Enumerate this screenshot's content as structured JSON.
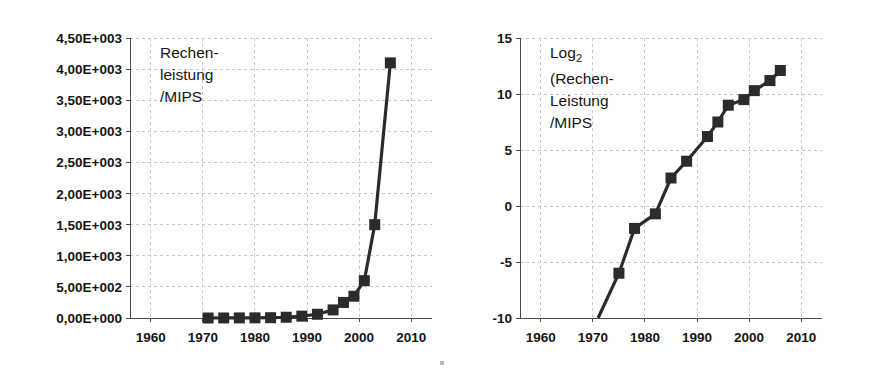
{
  "figure": {
    "background_color": "#ffffff",
    "ink_color": "#2b2b2b",
    "grid_color": "#c8c8c8"
  },
  "chart_data": [
    {
      "id": "left",
      "type": "line",
      "title": "Rechen-\nleistung\n/MIPS",
      "title_lines": [
        "Rechen-",
        "leistung",
        "/MIPS"
      ],
      "xlabel": "",
      "ylabel": "Rechenleistung /MIPS",
      "xlim": [
        1956,
        2014
      ],
      "ylim": [
        0,
        4500
      ],
      "grid": true,
      "legend": "none",
      "xticks": [
        1960,
        1970,
        1980,
        1990,
        2000,
        2010
      ],
      "xtick_labels": [
        "1960",
        "1970",
        "1980",
        "1990",
        "2000",
        "2010"
      ],
      "yticks": [
        0,
        500,
        1000,
        1500,
        2000,
        2500,
        3000,
        3500,
        4000,
        4500
      ],
      "ytick_labels": [
        "0,00E+000",
        "5,00E+002",
        "1,00E+003",
        "1,50E+003",
        "2,00E+003",
        "2,50E+003",
        "3,00E+003",
        "3,50E+003",
        "4,00E+003",
        "4,50E+003"
      ],
      "x": [
        1971,
        1974,
        1977,
        1980,
        1983,
        1986,
        1989,
        1992,
        1995,
        1997,
        1999,
        2001,
        2003,
        2006
      ],
      "values": [
        0.06,
        0.5,
        1.5,
        2.5,
        5,
        12,
        30,
        60,
        130,
        250,
        350,
        600,
        1500,
        4100
      ],
      "markers": "filled-square",
      "marker_count": 14
    },
    {
      "id": "right",
      "type": "line",
      "title": "Log2\n(Rechen-\nLeistung\n/MIPS",
      "title_lines": [
        "Log",
        "(Rechen-",
        "Leistung",
        "/MIPS"
      ],
      "title_subscript": "2",
      "xlabel": "",
      "ylabel": "Log2 (Rechenleistung /MIPS)",
      "xlim": [
        1956,
        2014
      ],
      "ylim": [
        -10,
        15
      ],
      "grid": true,
      "legend": "none",
      "xticks": [
        1960,
        1970,
        1980,
        1990,
        2000,
        2010
      ],
      "xtick_labels": [
        "1960",
        "1970",
        "1980",
        "1990",
        "2000",
        "2010"
      ],
      "yticks": [
        -10,
        -5,
        0,
        5,
        10,
        15
      ],
      "ytick_labels": [
        "-10",
        "-5",
        "0",
        "5",
        "10",
        "15"
      ],
      "x": [
        1971,
        1975,
        1978,
        1982,
        1985,
        1988,
        1992,
        1994,
        1996,
        1999,
        2001,
        2004,
        2006
      ],
      "values": [
        -10.0,
        -6.0,
        -2.0,
        -0.7,
        2.5,
        4.0,
        6.2,
        7.5,
        9.0,
        9.5,
        10.3,
        11.2,
        12.1
      ],
      "markers": "filled-square",
      "marker_count": 12
    }
  ]
}
